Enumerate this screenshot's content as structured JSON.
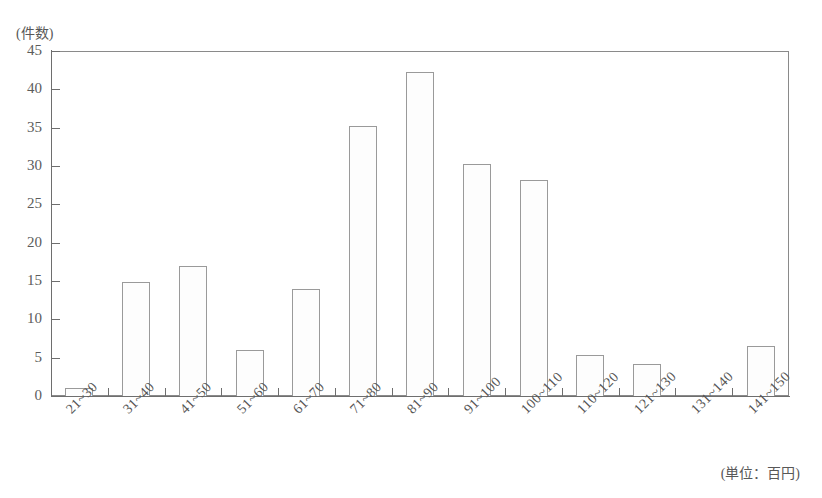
{
  "chart_data": {
    "type": "bar",
    "title": "",
    "subtitle": "",
    "xlabel": "",
    "ylabel": "(件数)",
    "x_unit_note": "(単位：百円)",
    "categories": [
      "21~30",
      "31~40",
      "41~50",
      "51~60",
      "61~70",
      "71~80",
      "81~90",
      "91~100",
      "100~110",
      "110~120",
      "121~130",
      "131~140",
      "141~150"
    ],
    "values": [
      1,
      14.9,
      17,
      6,
      14,
      35.2,
      42.2,
      30.3,
      28.2,
      5.3,
      4.2,
      0,
      6.5
    ],
    "ylim": [
      0,
      45
    ],
    "yticks": [
      0,
      5,
      10,
      15,
      20,
      25,
      30,
      35,
      40,
      45
    ],
    "ytick_labels": [
      "0",
      "5",
      "10",
      "15",
      "20",
      "25",
      "30",
      "35",
      "40",
      "45"
    ],
    "grid": false,
    "legend": null,
    "legend_position": "none",
    "bar_fill": "#fdfdfd",
    "bar_edge": "#9a9a9a",
    "axis_color": "#6e6e6e",
    "text_color": "#585858"
  }
}
